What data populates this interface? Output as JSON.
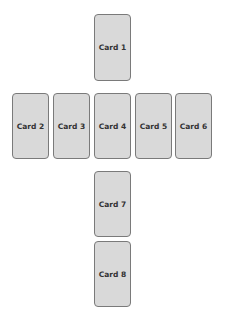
{
  "layout": "card-spread-cross",
  "cards": [
    {
      "label": "Card 1",
      "x": 94,
      "y": 14
    },
    {
      "label": "Card 2",
      "x": 12,
      "y": 93
    },
    {
      "label": "Card 3",
      "x": 53,
      "y": 93
    },
    {
      "label": "Card 4",
      "x": 94,
      "y": 93
    },
    {
      "label": "Card 5",
      "x": 135,
      "y": 93
    },
    {
      "label": "Card 6",
      "x": 175,
      "y": 93
    },
    {
      "label": "Card 7",
      "x": 94,
      "y": 171
    },
    {
      "label": "Card 8",
      "x": 94,
      "y": 241
    }
  ],
  "colors": {
    "card_fill": "#d9d9d9",
    "card_border": "#7a7a7a",
    "text": "#333333"
  }
}
